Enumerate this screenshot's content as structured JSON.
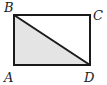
{
  "diagram": {
    "type": "geometry",
    "shape": "rectangle",
    "vertices": {
      "A": {
        "label": "A"
      },
      "B": {
        "label": "B"
      },
      "C": {
        "label": "C"
      },
      "D": {
        "label": "D"
      }
    },
    "segments": [
      "AB",
      "BC",
      "CD",
      "DA",
      "BD"
    ],
    "shaded_region": "triangle ABD",
    "colors": {
      "stroke": "#1a1a1a",
      "shade": "#e6e6e6"
    }
  }
}
